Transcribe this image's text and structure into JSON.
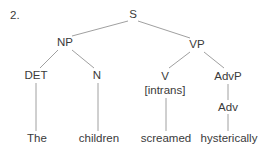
{
  "example_number": "2.",
  "tree": {
    "nodes": [
      {
        "id": "S",
        "label": "S",
        "x": 133,
        "y": 18
      },
      {
        "id": "NP",
        "label": "NP",
        "x": 65,
        "y": 46
      },
      {
        "id": "VP",
        "label": "VP",
        "x": 197,
        "y": 48
      },
      {
        "id": "DET",
        "label": "DET",
        "x": 36,
        "y": 79
      },
      {
        "id": "N",
        "label": "N",
        "x": 97,
        "y": 79
      },
      {
        "id": "V",
        "label": "V",
        "x": 165,
        "y": 80
      },
      {
        "id": "V_sub",
        "label": "[intrans]",
        "x": 165,
        "y": 94
      },
      {
        "id": "AdvP",
        "label": "AdvP",
        "x": 228,
        "y": 80
      },
      {
        "id": "Adv",
        "label": "Adv",
        "x": 228,
        "y": 111
      },
      {
        "id": "The",
        "label": "The",
        "x": 37,
        "y": 142
      },
      {
        "id": "children",
        "label": "children",
        "x": 99,
        "y": 142
      },
      {
        "id": "screamed",
        "label": "screamed",
        "x": 166,
        "y": 142
      },
      {
        "id": "hysterically",
        "label": "hysterically",
        "x": 229,
        "y": 142
      }
    ],
    "edges": [
      {
        "from": "S",
        "to": "NP",
        "x1": 128,
        "y1": 21,
        "x2": 72,
        "y2": 36
      },
      {
        "from": "S",
        "to": "VP",
        "x1": 138,
        "y1": 21,
        "x2": 190,
        "y2": 38
      },
      {
        "from": "NP",
        "to": "DET",
        "x1": 58,
        "y1": 50,
        "x2": 40,
        "y2": 68
      },
      {
        "from": "NP",
        "to": "N",
        "x1": 72,
        "y1": 50,
        "x2": 94,
        "y2": 68
      },
      {
        "from": "VP",
        "to": "V",
        "x1": 190,
        "y1": 52,
        "x2": 169,
        "y2": 68
      },
      {
        "from": "VP",
        "to": "AdvP",
        "x1": 204,
        "y1": 52,
        "x2": 224,
        "y2": 68
      },
      {
        "from": "DET",
        "to": "The",
        "x1": 36,
        "y1": 83,
        "x2": 36,
        "y2": 131
      },
      {
        "from": "N",
        "to": "children",
        "x1": 98,
        "y1": 83,
        "x2": 98,
        "y2": 131
      },
      {
        "from": "V",
        "to": "screamed",
        "x1": 166,
        "y1": 98,
        "x2": 166,
        "y2": 131
      },
      {
        "from": "AdvP",
        "to": "Adv",
        "x1": 228,
        "y1": 84,
        "x2": 228,
        "y2": 100
      },
      {
        "from": "Adv",
        "to": "hysterically",
        "x1": 228,
        "y1": 114,
        "x2": 228,
        "y2": 131
      }
    ]
  },
  "colors": {
    "text": "#3a3a3a",
    "edge": "#a0a0a0",
    "background": "#ffffff"
  }
}
